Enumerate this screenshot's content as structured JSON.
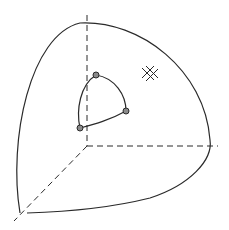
{
  "diagram": {
    "colors": {
      "line": "#2a2a2a",
      "dot_fill": "#8a8a8a",
      "dot_stroke": "#2a2a2a",
      "background": "#ffffff"
    },
    "axes": [
      {
        "name": "z-axis",
        "style": "dashed"
      },
      {
        "name": "y-axis",
        "style": "dashed"
      },
      {
        "name": "x-axis",
        "style": "dashed"
      }
    ],
    "vertices": [
      {
        "name": "vertex-top",
        "x": 96,
        "y": 75
      },
      {
        "name": "vertex-right",
        "x": 126,
        "y": 111
      },
      {
        "name": "vertex-left",
        "x": 80,
        "y": 128
      }
    ],
    "hatch_symbol": {
      "name": "cross-hatch-mark",
      "x": 150,
      "y": 74
    }
  }
}
